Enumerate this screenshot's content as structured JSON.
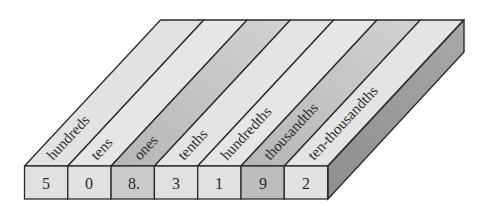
{
  "diagram": {
    "type": "place-value-chart",
    "number": "508.3192",
    "places": [
      {
        "label": "hundreds",
        "digit": "5",
        "top_color": "#e2e2e2",
        "front_color": "#e0e0e0"
      },
      {
        "label": "tens",
        "digit": "0",
        "top_color": "#e6e6e6",
        "front_color": "#e2e2e2"
      },
      {
        "label": "ones",
        "digit": "8.",
        "top_color": "#c4c4c4",
        "front_color": "#cbcbcb"
      },
      {
        "label": "tenths",
        "digit": "3",
        "top_color": "#e4e4e4",
        "front_color": "#e0e0e0"
      },
      {
        "label": "hundredths",
        "digit": "1",
        "top_color": "#e6e6e6",
        "front_color": "#e2e2e2"
      },
      {
        "label": "thousandths",
        "digit": "9",
        "top_color": "#c2c2c2",
        "front_color": "#bdbdbd"
      },
      {
        "label": "ten-thousandths",
        "digit": "2",
        "top_color": "#e4e4e4",
        "front_color": "#e2e2e2"
      }
    ],
    "colors": {
      "outline": "#2a2a2a",
      "side_face": "#9c9c9c",
      "background": "#ffffff"
    }
  }
}
